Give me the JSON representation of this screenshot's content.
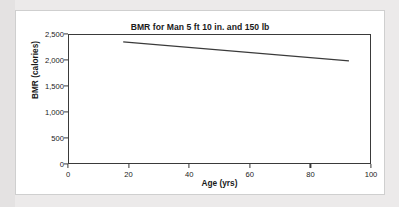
{
  "chart_data": {
    "type": "line",
    "title": "BMR for Man 5 ft 10 in. and 150 lb",
    "xlabel": "Age (yrs)",
    "ylabel": "BMR (calories)",
    "xlim": [
      0,
      100
    ],
    "ylim": [
      0,
      2500
    ],
    "xticks": [
      0,
      20,
      40,
      60,
      80,
      100
    ],
    "xtick_labels": [
      "0",
      "20",
      "40",
      "60",
      "80",
      "100"
    ],
    "yticks": [
      0,
      500,
      1000,
      1500,
      2000,
      2500
    ],
    "ytick_labels": [
      "0",
      "500",
      "1,000",
      "1,500",
      "2,000",
      "2,500"
    ],
    "grid": false,
    "legend": false,
    "series": [
      {
        "name": "BMR",
        "color": "#3a3a3a",
        "x": [
          18,
          93
        ],
        "values": [
          2365,
          1995
        ]
      }
    ]
  },
  "figure": {
    "line_color": "#3a3a3a",
    "axis_color": "#3a3a3a",
    "background": "#ffffff",
    "page_background": "#eceaea"
  }
}
